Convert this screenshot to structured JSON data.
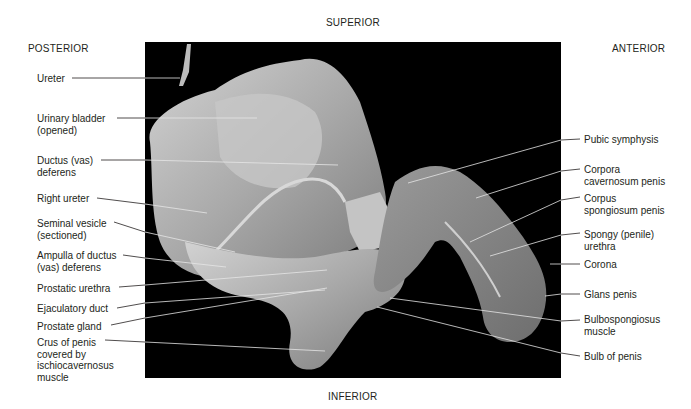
{
  "orientation": {
    "superior": "SUPERIOR",
    "inferior": "INFERIOR",
    "posterior": "POSTERIOR",
    "anterior": "ANTERIOR"
  },
  "figure": {
    "background_color": "#000000",
    "tissue_color": "#b8b8b8",
    "leader_color_outside": "#231f20",
    "leader_color_inside": "#e0e0e0"
  },
  "labels_left": [
    {
      "text": "Ureter",
      "x": 37,
      "y": 73
    },
    {
      "text": "Urinary bladder\n(opened)",
      "x": 37,
      "y": 113
    },
    {
      "text": "Ductus (vas)\ndeferens",
      "x": 37,
      "y": 155
    },
    {
      "text": "Right ureter",
      "x": 37,
      "y": 193
    },
    {
      "text": "Seminal vesicle\n(sectioned)",
      "x": 37,
      "y": 218
    },
    {
      "text": "Ampulla of ductus\n(vas) deferens",
      "x": 37,
      "y": 250
    },
    {
      "text": "Prostatic urethra",
      "x": 37,
      "y": 283
    },
    {
      "text": "Ejaculatory duct",
      "x": 37,
      "y": 303
    },
    {
      "text": "Prostate gland",
      "x": 37,
      "y": 321
    },
    {
      "text": "Crus of penis\ncovered by\nischiocavernosus\nmuscle",
      "x": 37,
      "y": 337
    }
  ],
  "labels_right": [
    {
      "text": "Pubic symphysis",
      "x": 584,
      "y": 134
    },
    {
      "text": "Corpora\ncavernosum penis",
      "x": 584,
      "y": 164
    },
    {
      "text": "Corpus\nspongiosum penis",
      "x": 584,
      "y": 193
    },
    {
      "text": "Spongy (penile)\nurethra",
      "x": 584,
      "y": 229
    },
    {
      "text": "Corona",
      "x": 584,
      "y": 259
    },
    {
      "text": "Glans penis",
      "x": 584,
      "y": 289
    },
    {
      "text": "Bulbospongiosus\nmuscle",
      "x": 584,
      "y": 314
    },
    {
      "text": "Bulb of penis",
      "x": 584,
      "y": 351
    }
  ]
}
